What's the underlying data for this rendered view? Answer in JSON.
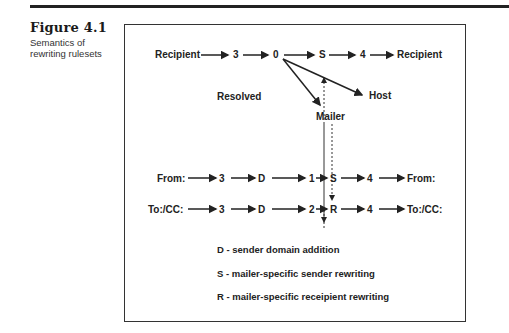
{
  "figure": {
    "number": "Figure 4.1",
    "caption": "Semantics of rewriting rulesets"
  },
  "diagram": {
    "row1": {
      "start": "Recipient",
      "n1": "3",
      "n2": "0",
      "n3": "S",
      "n4": "4",
      "end": "Recipient"
    },
    "branches": {
      "resolved": "Resolved",
      "mailer": "Mailer",
      "host": "Host"
    },
    "row2": {
      "start": "From:",
      "n1": "3",
      "n2": "D",
      "n3": "1",
      "n4": "S",
      "n5": "4",
      "end": "From:"
    },
    "row3": {
      "start": "To:/CC:",
      "n1": "3",
      "n2": "D",
      "n3": "2",
      "n4": "R",
      "n5": "4",
      "end": "To:/CC:"
    }
  },
  "legend": [
    "D - sender domain addition",
    "S - mailer-specific sender rewriting",
    "R - mailer-specific receipient rewriting"
  ]
}
